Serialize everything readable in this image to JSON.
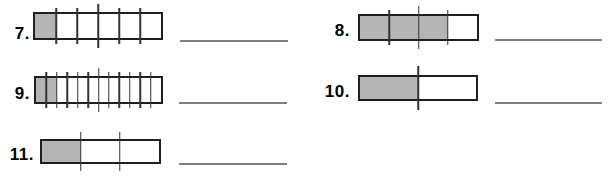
{
  "worksheet": {
    "items": [
      {
        "label": "7.",
        "segments": 6,
        "shaded": 1,
        "answer_value": ""
      },
      {
        "label": "8.",
        "segments": 4,
        "shaded": 3,
        "answer_value": ""
      },
      {
        "label": "9.",
        "segments": 12,
        "shaded": 2,
        "answer_value": ""
      },
      {
        "label": "10.",
        "segments": 2,
        "shaded": 1,
        "answer_value": ""
      },
      {
        "label": "11.",
        "segments": 3,
        "shaded": 1,
        "answer_value": ""
      }
    ],
    "colors": {
      "background": "#ffffff",
      "shade_fill": "#b5b5b5",
      "bar_border": "#1f1f1f",
      "tick_line": "#333333",
      "answer_line": "#7f7f7f",
      "label_text": "#000000"
    }
  }
}
